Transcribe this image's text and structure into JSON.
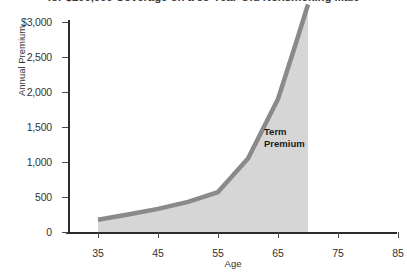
{
  "chart_data": {
    "type": "area",
    "title": "for $100,000 Coverage on a 35-Year-Old Nonsmoking Male",
    "xlabel": "Age",
    "ylabel": "Annual Premium",
    "xlim": [
      30,
      85
    ],
    "ylim": [
      0,
      3000
    ],
    "grid": false,
    "legend": "none",
    "x": [
      35,
      40,
      45,
      50,
      55,
      60,
      65,
      68,
      70
    ],
    "values": [
      175,
      250,
      330,
      430,
      570,
      1050,
      1900,
      2700,
      3250
    ],
    "series": [
      {
        "name": "Term Premium",
        "values": [
          175,
          250,
          330,
          430,
          570,
          1050,
          1900,
          2700,
          3250
        ]
      }
    ],
    "xticks": [
      "35",
      "45",
      "55",
      "65",
      "75",
      "85"
    ],
    "xtick_values": [
      35,
      45,
      55,
      65,
      75,
      85
    ],
    "yticks": [
      "0",
      "500",
      "1,000",
      "1,500",
      "2,000",
      "2,500",
      "$3,000"
    ],
    "ytick_values": [
      0,
      500,
      1000,
      1500,
      2000,
      2500,
      3000
    ],
    "annotations": [
      {
        "text_line1": "Term",
        "text_line2": "Premium",
        "x": 66,
        "y": 1450
      }
    ],
    "colors": {
      "area_fill": "#d6d6d6",
      "line": "#8a8a8a",
      "axis": "#2b2b2b",
      "text": "#333333",
      "background": "#ffffff"
    }
  }
}
